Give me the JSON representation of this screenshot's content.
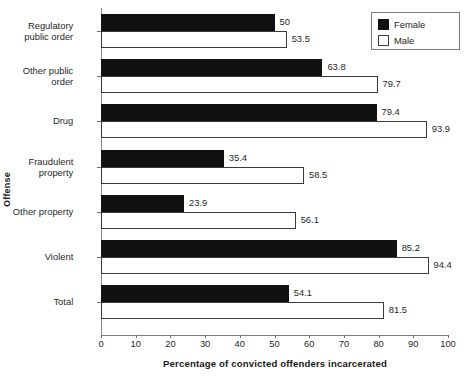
{
  "chart_data": {
    "type": "bar",
    "orientation": "horizontal",
    "title": "",
    "xlabel": "Percentage of convicted offenders incarcerated",
    "ylabel": "Offense",
    "xlim": [
      0,
      100
    ],
    "xticks": [
      0,
      10,
      20,
      30,
      40,
      50,
      60,
      70,
      80,
      90,
      100
    ],
    "grid": false,
    "legend_position": "top-right",
    "categories": [
      "Regulatory public order",
      "Other public order",
      "Drug",
      "Fraudulent property",
      "Other property",
      "Violent",
      "Total"
    ],
    "category_lines": [
      [
        "Regulatory",
        "public order"
      ],
      [
        "Other public",
        "order"
      ],
      [
        "Drug"
      ],
      [
        "Fraudulent",
        "property"
      ],
      [
        "Other property"
      ],
      [
        "Violent"
      ],
      [
        "Total"
      ]
    ],
    "series": [
      {
        "name": "Female",
        "color": "#111111",
        "values": [
          50,
          63.8,
          79.4,
          35.4,
          23.9,
          85.2,
          54.1
        ],
        "labels": [
          "50",
          "63.8",
          "79.4",
          "35.4",
          "23.9",
          "85.2",
          "54.1"
        ]
      },
      {
        "name": "Male",
        "color": "#ffffff",
        "values": [
          53.5,
          79.7,
          93.9,
          58.5,
          56.1,
          94.4,
          81.5
        ],
        "labels": [
          "53.5",
          "79.7",
          "93.9",
          "58.5",
          "56.1",
          "94.4",
          "81.5"
        ]
      }
    ]
  },
  "legend": {
    "items": [
      {
        "label": "Female",
        "swatch": "filled-black-square"
      },
      {
        "label": "Male",
        "swatch": "outlined-white-square"
      }
    ]
  },
  "axes": {
    "y_title": "Offense",
    "x_title": "Percentage of convicted offenders incarcerated",
    "x_tick_labels": [
      "0",
      "10",
      "20",
      "30",
      "40",
      "50",
      "60",
      "70",
      "80",
      "90",
      "100"
    ]
  }
}
